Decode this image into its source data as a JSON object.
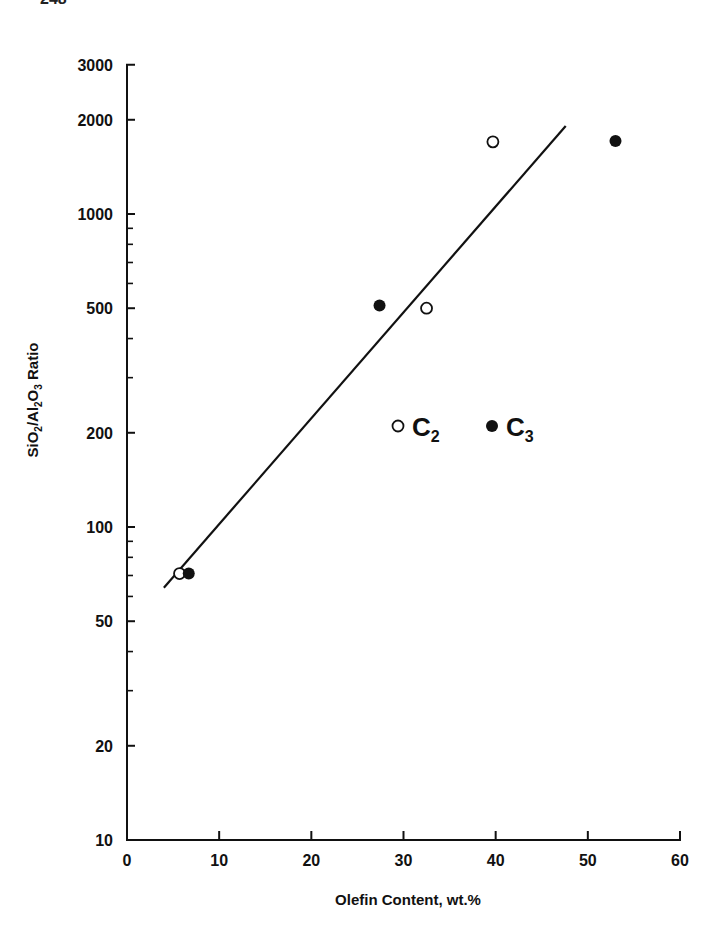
{
  "page": {
    "number_partial": "248"
  },
  "chart_data": {
    "type": "scatter",
    "title": "",
    "xlabel": "Olefin Content, wt.%",
    "ylabel": "SiO2/Al2O3 Ratio",
    "xlim": [
      0,
      60
    ],
    "ylim": [
      10,
      3000
    ],
    "yscale": "log",
    "grid": false,
    "x_ticks": [
      0,
      10,
      20,
      30,
      40,
      50,
      60
    ],
    "y_ticks": [
      10,
      20,
      50,
      100,
      200,
      500,
      1000,
      2000,
      3000
    ],
    "y_minor_ticks": [
      30,
      40,
      60,
      70,
      80,
      90,
      300,
      400,
      600,
      700,
      800,
      900
    ],
    "legend": {
      "position": "inside-center-right",
      "entries": [
        {
          "label": "C2",
          "marker": "open-circle"
        },
        {
          "label": "C3",
          "marker": "filled-circle"
        }
      ]
    },
    "series": [
      {
        "name": "C2",
        "marker": "open-circle",
        "points": [
          {
            "x": 5.7,
            "y": 71
          },
          {
            "x": 32.5,
            "y": 500
          },
          {
            "x": 39.7,
            "y": 1700
          }
        ]
      },
      {
        "name": "C3",
        "marker": "filled-circle",
        "points": [
          {
            "x": 6.7,
            "y": 71
          },
          {
            "x": 27.4,
            "y": 510
          },
          {
            "x": 53.0,
            "y": 1710
          }
        ]
      }
    ],
    "fit_line": {
      "x": [
        4.0,
        47.6
      ],
      "y": [
        64,
        1910
      ],
      "style": "solid"
    }
  },
  "labels": {
    "ylabel_parts": {
      "a": "SiO",
      "a_sub": "2",
      "b": "/Al",
      "b_sub": "2",
      "c": "O",
      "c_sub": "3",
      "d": " Ratio"
    },
    "legend_c2_main": "C",
    "legend_c2_sub": "2",
    "legend_c3_main": "C",
    "legend_c3_sub": "3"
  }
}
